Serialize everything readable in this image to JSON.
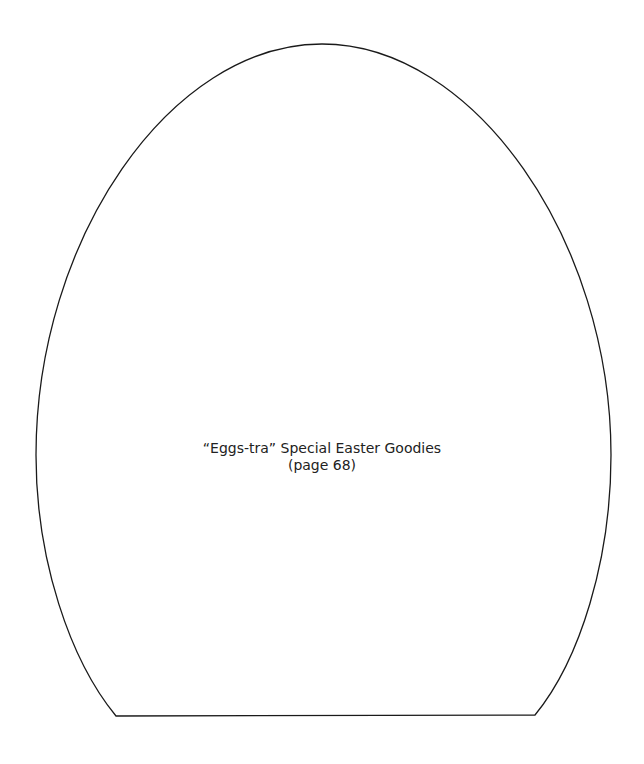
{
  "template": {
    "shape": "egg",
    "stroke_color": "#1a1a1a",
    "background": "#ffffff"
  },
  "caption": {
    "title": "“Eggs-tra” Special Easter Goodies",
    "page_ref": "(page 68)"
  }
}
